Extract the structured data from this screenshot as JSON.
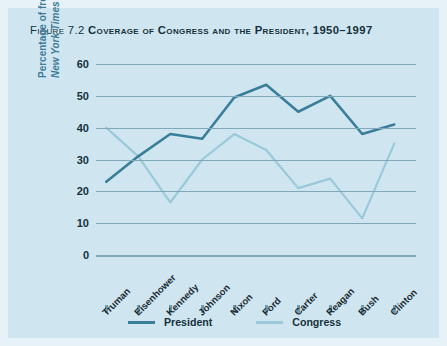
{
  "figure": {
    "number_label": "Figure 7.2",
    "title": "Coverage of Congress and the President, 1950–1997",
    "background_color": "#cfe6f0",
    "outer_background_color": "#e7f2f8"
  },
  "legend": {
    "position": "bottom-center",
    "items": [
      {
        "label": "President",
        "color": "#3a7e99"
      },
      {
        "label": "Congress",
        "color": "#9ac9dc"
      }
    ]
  },
  "axes": {
    "y_title_line1": "Percentage of front-page",
    "y_title_line2_italic": "New York Times",
    "y_title_line2_rest": " stories",
    "y_ticks": [
      "0",
      "10",
      "20",
      "30",
      "40",
      "50",
      "60"
    ],
    "y_title_color": "#3f7c99",
    "gridline_color": "#7fa8bb"
  },
  "chart_data": {
    "type": "line",
    "title": "Coverage of Congress and the President, 1950–1997",
    "xlabel": "",
    "ylabel": "Percentage of front-page New York Times stories",
    "ylim": [
      0,
      60
    ],
    "yticks": [
      0,
      10,
      20,
      30,
      40,
      50,
      60
    ],
    "grid": true,
    "legend_position": "bottom-center",
    "categories": [
      "Truman",
      "Eisenhower",
      "Kennedy",
      "Johnson",
      "Nixon",
      "Ford",
      "Carter",
      "Reagan",
      "Bush",
      "Clinton"
    ],
    "series": [
      {
        "name": "President",
        "color": "#3a7e99",
        "values": [
          23,
          31,
          38,
          36.5,
          49.5,
          53.5,
          45,
          50,
          38,
          41
        ]
      },
      {
        "name": "Congress",
        "color": "#9ac9dc",
        "values": [
          40,
          31,
          16.5,
          30,
          38,
          33,
          21,
          24,
          11.5,
          35
        ]
      }
    ]
  }
}
